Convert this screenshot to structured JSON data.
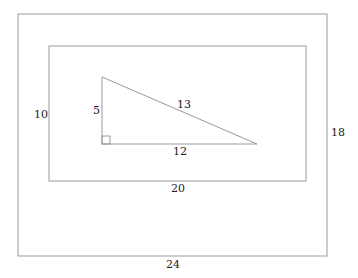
{
  "diagram": {
    "outer_rect": {
      "width_label": "24",
      "height_label": "18"
    },
    "inner_rect": {
      "width_label": "20",
      "height_label": "10"
    },
    "triangle": {
      "leg_vertical": "5",
      "leg_horizontal": "12",
      "hypotenuse": "13"
    },
    "colors": {
      "stroke": "#999999",
      "text": "#222222"
    }
  }
}
